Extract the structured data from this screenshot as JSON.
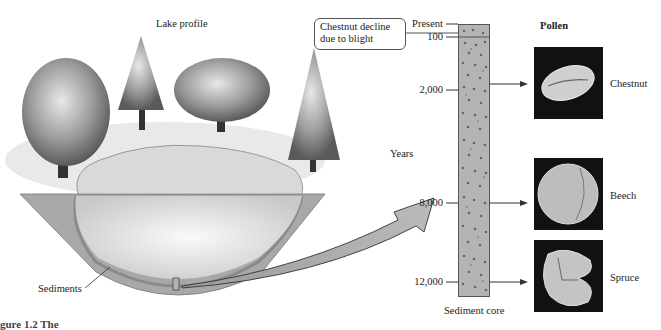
{
  "diagram": {
    "lake_title": "Lake profile",
    "sediments_label": "Sediments",
    "callout_text_line1": "Chestnut decline",
    "callout_text_line2": "due to blight",
    "years_axis_label": "Years",
    "core_label": "Sediment core",
    "pollen_header": "Pollen",
    "ticks": [
      {
        "label": "Present",
        "y": 24
      },
      {
        "label": "100",
        "y": 35
      },
      {
        "label": "2,000",
        "y": 90
      },
      {
        "label": "8,000",
        "y": 203
      },
      {
        "label": "12,000",
        "y": 282
      }
    ],
    "pollen": [
      {
        "name": "Chestnut",
        "arrow_y": 84
      },
      {
        "name": "Beech",
        "arrow_y": 203
      },
      {
        "name": "Spruce",
        "arrow_y": 282
      }
    ],
    "caption_fragment": "gure 1.2  The"
  },
  "colors": {
    "core_fill": "#b4b4b4",
    "sediment_band": "#9a9a9a",
    "ground": "#a8a8a8",
    "pollen_bg": "#111111"
  }
}
